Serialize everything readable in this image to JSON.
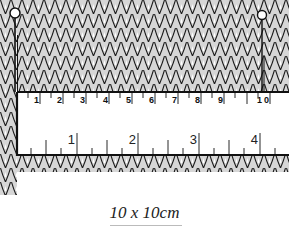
{
  "figure": {
    "knit_fill_color": "#d6d6d6",
    "knit_line_color": "#1a1a1a",
    "ruler_color": "#ffffff",
    "pins": [
      {
        "name": "left-pin",
        "x": 15
      },
      {
        "name": "right-pin",
        "x": 262
      }
    ],
    "ruler_top": {
      "unit": "cm",
      "labels": [
        "1",
        "2",
        "3",
        "4",
        "5",
        "6",
        "7",
        "8",
        "9",
        "10"
      ]
    },
    "ruler_bottom": {
      "unit": "inch",
      "labels": [
        "1",
        "2",
        "3",
        "4"
      ]
    }
  },
  "caption": {
    "text": "10 x 10cm"
  }
}
